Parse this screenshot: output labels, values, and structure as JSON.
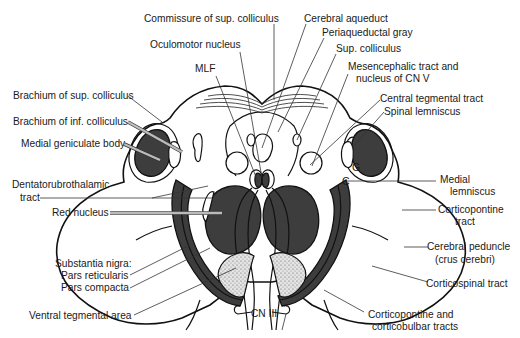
{
  "figure": {
    "colors": {
      "outline": "#111111",
      "dark_fill": "#3d3d3d",
      "stipple_fill": "#d6d6d6",
      "leader_line": "#333333",
      "background": "#ffffff"
    }
  },
  "labels": {
    "commissure_sup_colliculus": "Commissure of sup. colliculus",
    "cerebral_aqueduct": "Cerebral aqueduct",
    "periaqueductal_gray": "Periaqueductal gray",
    "sup_colliculus": "Sup. colliculus",
    "oculomotor_nucleus": "Oculomotor nucleus",
    "mlf": "MLF",
    "mesencephalic_tract_line1": "Mesencephalic tract and",
    "mesencephalic_tract_line2": "nucleus of CN V",
    "central_tegmental_tract": "Central tegmental tract",
    "spinal_lemniscus": "Spinal lemniscus",
    "brachium_sup_colliculus": "Brachium of sup. colliculus",
    "brachium_inf_colliculus": "Brachium of inf. colliculus",
    "medial_geniculate_body": "Medial geniculate body",
    "dentatorubrothalamic_line1": "Dentatorubrothalamic",
    "dentatorubrothalamic_line2": "tract",
    "red_nucleus": "Red nucleus",
    "medial_lemniscus_line1": "Medial",
    "medial_lemniscus_line2": "lemniscus",
    "corticopontine_tract_line1": "Corticopontine",
    "corticopontine_tract_line2": "tract",
    "substantia_nigra": "Substantia nigra:",
    "pars_reticularis": "Pars reticularis",
    "pars_compacta": "Pars compacta",
    "cerebral_peduncle_line1": "Cerebral peduncle",
    "cerebral_peduncle_line2": "(crus cerebri)",
    "corticospinal_tract": "Corticospinal tract",
    "ventral_tegmental_area": "Ventral tegmental area",
    "cn_iii": "CN III",
    "corticopontine_corticobulbar_line1": "Corticopontine and",
    "corticopontine_corticobulbar_line2": "corticobulbar tracts",
    "letter_g": "G",
    "letter_c": "C"
  }
}
